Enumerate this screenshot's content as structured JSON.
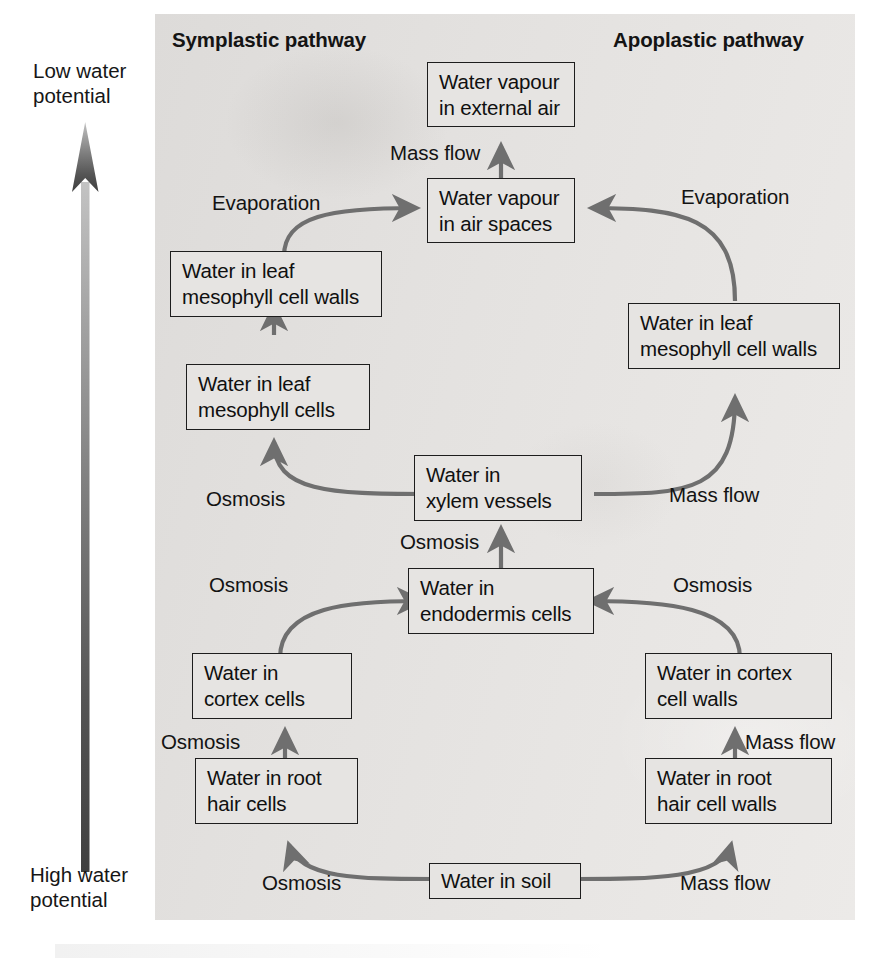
{
  "figure": {
    "kind": "flow-diagram",
    "panel_bg_color": "#e4e2e0",
    "box_fill_color": "#e6e4e2",
    "box_border_color": "#1d1d1d",
    "arrow_color": "#6b6b6b",
    "text_color": "#101010"
  },
  "titles": {
    "symplastic": "Symplastic pathway",
    "apoplastic": "Apoplastic pathway"
  },
  "axis": {
    "name": "water-potential-gradient",
    "top_label": {
      "line1": "Low water",
      "line2": "potential"
    },
    "bottom_label": {
      "line1": "High water",
      "line2": "potential"
    },
    "direction": "points upward, from high water potential at the bottom to low water potential at the top",
    "gradient_from": "#4a4a4a",
    "gradient_to": "#b8b8b8"
  },
  "nodes": {
    "vapour_external": {
      "line1": "Water vapour",
      "line2": "in external air"
    },
    "vapour_airspaces": {
      "line1": "Water vapour",
      "line2": "in air spaces"
    },
    "sym_mesophyll_walls": {
      "line1": "Water in leaf",
      "line2": "mesophyll cell walls"
    },
    "sym_mesophyll_cells": {
      "line1": "Water in leaf",
      "line2": "mesophyll cells"
    },
    "apo_mesophyll_walls": {
      "line1": "Water in leaf",
      "line2": "mesophyll cell walls"
    },
    "xylem": {
      "line1": "Water in",
      "line2": "xylem vessels"
    },
    "endodermis": {
      "line1": "Water in",
      "line2": "endodermis cells"
    },
    "sym_cortex_cells": {
      "line1": "Water in",
      "line2": "cortex cells"
    },
    "apo_cortex_walls": {
      "line1": "Water in cortex",
      "line2": "cell walls"
    },
    "sym_root_hair_cells": {
      "line1": "Water in root",
      "line2": "hair cells"
    },
    "apo_root_hair_walls": {
      "line1": "Water in root",
      "line2": "hair cell walls"
    },
    "soil": {
      "line1": "Water in soil",
      "line2": ""
    }
  },
  "edge_labels": {
    "mass_flow_vapour": "Mass flow",
    "evaporation_sym": "Evaporation",
    "evaporation_apo": "Evaporation",
    "osmosis_xylem_to_mesophyll": "Osmosis",
    "mass_flow_xylem_to_apo_walls": "Mass flow",
    "osmosis_endodermis_to_xylem": "Osmosis",
    "osmosis_cortex_to_endodermis": "Osmosis",
    "osmosis_apo_cortex_to_endodermis": "Osmosis",
    "osmosis_root_hair_to_cortex": "Osmosis",
    "mass_flow_root_hair_walls_to_cortex_walls": "Mass flow",
    "osmosis_soil_to_root_hair": "Osmosis",
    "mass_flow_soil_to_root_hair_walls": "Mass flow"
  }
}
